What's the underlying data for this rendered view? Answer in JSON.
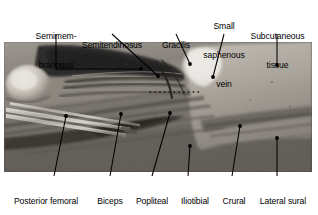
{
  "figure": {
    "type": "anatomical-dissection-photograph",
    "region": "popliteal fossa, posterior thigh and knee",
    "modality": "grayscale cadaveric dissection photograph",
    "colors": {
      "background": "#ffffff",
      "text": "#000000",
      "leader_line": "#000000",
      "photo_dark": "#1b1917",
      "photo_mid": "#7a7670",
      "photo_light": "#d8d4cd"
    }
  },
  "labels_top": [
    {
      "id": "semimembranosus",
      "name": "Semimembranosus",
      "lines": [
        "Semimem-",
        "branosus"
      ],
      "leader": "vertical-bracket"
    },
    {
      "id": "semitendinosus",
      "name": "Semitendinosus",
      "lines": [
        "Semitendinosus"
      ],
      "leader": "diagonal"
    },
    {
      "id": "gracilis",
      "name": "Gracilis",
      "lines": [
        "Gracilis"
      ],
      "leader": "diagonal"
    },
    {
      "id": "small-saphenous-vein",
      "name": "Small saphenous vein",
      "lines": [
        "Small",
        "saphenous",
        "vein"
      ],
      "leader": "vertical"
    },
    {
      "id": "subcutaneous-tissue",
      "name": "Subcutaneous tissue",
      "lines": [
        "Subcutaneous",
        "tissue"
      ],
      "leader": "vertical"
    }
  ],
  "labels_bottom": [
    {
      "id": "posterior-femoral-cutaneous-nerve",
      "name": "Posterior femoral cutaneous nerve",
      "lines": [
        "Posterior femoral",
        "cutaneous nerve"
      ],
      "leader": "diagonal"
    },
    {
      "id": "biceps-femoris",
      "name": "Biceps femoris",
      "lines": [
        "Biceps",
        "femoris"
      ],
      "leader": "diagonal"
    },
    {
      "id": "popliteal-fat",
      "name": "Popliteal fat",
      "lines": [
        "Popliteal",
        "fat"
      ],
      "leader": "diagonal"
    },
    {
      "id": "iliotibial-tract",
      "name": "Iliotibial tract",
      "lines": [
        "Iliotibial",
        "tract"
      ],
      "leader": "vertical"
    },
    {
      "id": "crural-fascia",
      "name": "Crural fascia",
      "lines": [
        "Crural",
        "fascia"
      ],
      "leader": "diagonal"
    },
    {
      "id": "lateral-sural-cutaneous-nerve",
      "name": "Lateral sural cutaneous nerve",
      "lines": [
        "Lateral sural",
        "cutaneous",
        "nerve"
      ],
      "leader": "vertical"
    }
  ],
  "photo_features": [
    {
      "id": "forceps",
      "name": "surgical forceps retracting hamstring tendons"
    },
    {
      "id": "dotted-incision-line",
      "name": "dotted reference line over fascia"
    },
    {
      "id": "reflected-skin-flap",
      "name": "reflected skin and subcutaneous flap"
    }
  ]
}
